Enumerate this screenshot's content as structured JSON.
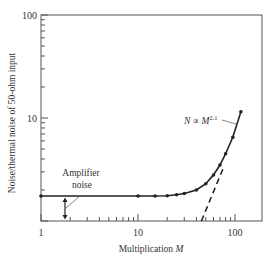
{
  "chart_data": {
    "type": "line",
    "title": "",
    "xlabel": "Multiplication M",
    "ylabel": "Noise/thermal noise of 50-ohm input",
    "xscale": "log",
    "yscale": "log",
    "xlim": [
      1,
      190
    ],
    "ylim": [
      1,
      100
    ],
    "x_ticks": [
      1,
      10,
      100
    ],
    "x_tick_labels": [
      "1",
      "10",
      "100"
    ],
    "y_ticks": [
      10,
      100
    ],
    "y_tick_labels": [
      "10",
      "100"
    ],
    "grid": false,
    "legend": null,
    "series": [
      {
        "name": "Measured noise",
        "style": "solid line with dot markers",
        "x": [
          1,
          10,
          15,
          20,
          25,
          30,
          40,
          50,
          60,
          70,
          80,
          95,
          115
        ],
        "y": [
          1.75,
          1.75,
          1.75,
          1.76,
          1.8,
          1.85,
          2.0,
          2.3,
          2.8,
          3.5,
          4.5,
          6.5,
          11.5
        ]
      },
      {
        "name": "N ∝ M^2.1 asymptote",
        "style": "dashed line",
        "x": [
          45,
          75
        ],
        "y": [
          1.0,
          3.2
        ]
      }
    ],
    "annotations": [
      {
        "text": "Amplifier noise",
        "target": "vertical arrow at M≈1.8 from 1 to 1.75"
      },
      {
        "text": "N ∝ M^2.1",
        "target": "upper part of curve"
      }
    ]
  },
  "labels": {
    "x_tick_1": "1",
    "x_tick_10": "10",
    "x_tick_100": "100",
    "y_tick_10": "10",
    "y_tick_100": "100",
    "xlabel_main": "Multiplication ",
    "xlabel_var": "M",
    "ylabel": "Noise/thermal noise of 50-ohm input",
    "amp_line1": "Amplifier",
    "amp_line2": "noise",
    "power_law_N": "N",
    "power_law_prop": " ∝ ",
    "power_law_M": "M",
    "power_law_exp": "2.1"
  }
}
